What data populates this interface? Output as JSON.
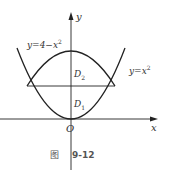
{
  "figure": {
    "caption_prefix": "图",
    "caption_number": "9-12"
  },
  "labels": {
    "y_axis": "y",
    "x_axis": "x",
    "origin": "O",
    "curve_upper": "y=4−x",
    "curve_upper_exp": "2",
    "curve_lower": "y=x",
    "curve_lower_exp": "2",
    "region_upper": "D",
    "region_upper_sub": "2",
    "region_lower": "D",
    "region_lower_sub": "1"
  },
  "colors": {
    "stroke": "#222222",
    "text": "#333333",
    "caption": "#555555"
  }
}
